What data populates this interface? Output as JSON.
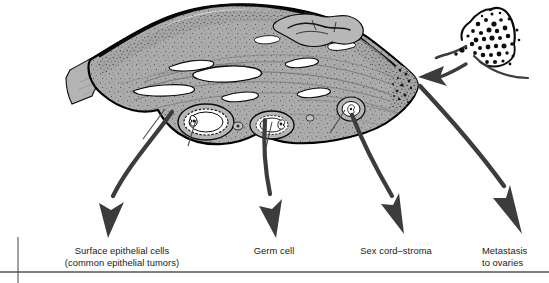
{
  "figure": {
    "background_color": "#ffffff"
  },
  "colors": {
    "ovary_fill": "#a8a8a8",
    "ovary_fill_light": "#bdbdbd",
    "ovary_outline": "#000000",
    "arrow": "#3c3c3c",
    "leader_line": "#4a4a4a",
    "rule_line": "#555555",
    "text": "#1a1a1a",
    "metastasis_mass": "#101010",
    "follicle_lumen": "#ffffff"
  },
  "labels": [
    {
      "id": "surface-epithelial",
      "text": "Surface epithelial cells\n(common epithelial tumors)",
      "line1": "Surface epithelial cells",
      "line2": "(common epithelial tumors)"
    },
    {
      "id": "germ-cell",
      "text": "Germ cell",
      "line1": "Germ cell",
      "line2": ""
    },
    {
      "id": "sex-cord",
      "text": "Sex cord–stroma",
      "line1": "Sex cord–stroma",
      "line2": ""
    },
    {
      "id": "metastasis",
      "text": "Metastasis\nto ovaries",
      "line1": "Metastasis",
      "line2": "to ovaries"
    }
  ],
  "anatomy": {
    "ovary_label": "ovary-cross-section",
    "hilum_label": "ovarian-hilum",
    "mesovarium_label": "mesovarium-attachment",
    "surface_epithelium_label": "surface-epithelium",
    "follicles_label": "ovarian-follicles",
    "corpus_luteum_label": "corpus-luteum",
    "metastatic_mass_label": "metastatic-tumor-mass"
  },
  "arrows": [
    {
      "id": "arrow-surface-epithelial",
      "from": "ovary-inferior-left",
      "to": "surface-epithelial-label"
    },
    {
      "id": "arrow-germ-cell",
      "from": "ovary-follicle",
      "to": "germ-cell-label"
    },
    {
      "id": "arrow-sex-cord",
      "from": "ovary-stroma",
      "to": "sex-cord-label"
    },
    {
      "id": "arrow-metastasis-out",
      "from": "ovary-hilum",
      "to": "metastasis-label"
    },
    {
      "id": "arrow-metastasis-in",
      "from": "metastatic-tumor-mass",
      "to": "ovary-hilum"
    }
  ]
}
